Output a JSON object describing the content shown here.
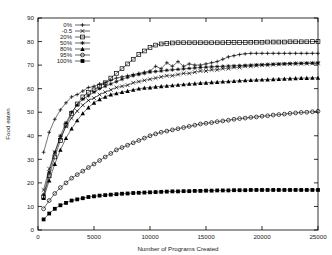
{
  "chart_data": {
    "type": "line",
    "title": "",
    "xlabel": "Number of Programs Created",
    "ylabel": "Food eaten",
    "xlim": [
      0,
      25000
    ],
    "ylim": [
      0,
      90
    ],
    "xticks": [
      0,
      5000,
      10000,
      15000,
      20000,
      25000
    ],
    "xtick_labels": [
      "0",
      "5000",
      "10000",
      "15000",
      "20000",
      "25000"
    ],
    "yticks": [
      0,
      10,
      20,
      30,
      40,
      50,
      60,
      70,
      80,
      90
    ],
    "ytick_labels": [
      "0",
      "10",
      "20",
      "30",
      "40",
      "50",
      "60",
      "70",
      "80",
      "90"
    ],
    "grid": false,
    "legend_position": "top-left-inside",
    "frame": true,
    "colors": {
      "ink": "#000000",
      "background": "#ffffff"
    },
    "x": [
      500,
      1000,
      1500,
      2000,
      2500,
      3000,
      3500,
      4000,
      4500,
      5000,
      5500,
      6000,
      6500,
      7000,
      7500,
      8000,
      8500,
      9000,
      9500,
      10000,
      10500,
      11000,
      11500,
      12000,
      12500,
      13000,
      13500,
      14000,
      14500,
      15000,
      15500,
      16000,
      16500,
      17000,
      17500,
      18000,
      18500,
      19000,
      19500,
      20000,
      20500,
      21000,
      21500,
      22000,
      22500,
      23000,
      23500,
      24000,
      24500,
      25000
    ],
    "series": [
      {
        "name": "0%",
        "label": "0%",
        "marker": "plus",
        "values": [
          33.0,
          41.5,
          47.0,
          51.0,
          54.0,
          56.5,
          57.5,
          59.0,
          60.5,
          61.0,
          62.0,
          62.5,
          63.5,
          64.5,
          65.0,
          65.5,
          66.0,
          66.5,
          67.0,
          67.5,
          69.5,
          68.5,
          71.0,
          69.5,
          71.5,
          69.5,
          70.5,
          70.0,
          70.0,
          70.5,
          71.0,
          71.5,
          72.5,
          73.5,
          74.0,
          74.5,
          74.8,
          75.0,
          75.0,
          75.0,
          75.0,
          75.0,
          75.0,
          75.0,
          75.0,
          75.0,
          75.0,
          75.0,
          75.0,
          75.0
        ]
      },
      {
        "name": "-0.5",
        "label": "-0.5",
        "marker": "cross",
        "values": [
          17.0,
          26.0,
          33.0,
          39.0,
          44.0,
          47.5,
          50.5,
          53.0,
          55.0,
          56.0,
          57.5,
          58.5,
          59.5,
          60.5,
          61.0,
          61.5,
          62.5,
          63.0,
          63.5,
          64.0,
          64.5,
          65.0,
          65.5,
          65.5,
          66.0,
          66.5,
          66.5,
          67.0,
          67.5,
          67.5,
          68.0,
          68.0,
          68.5,
          68.5,
          69.0,
          69.0,
          69.5,
          69.5,
          69.8,
          70.0,
          70.0,
          70.2,
          70.3,
          70.4,
          70.5,
          70.5,
          70.6,
          70.6,
          70.7,
          70.7
        ]
      },
      {
        "name": "20%",
        "label": "20%",
        "marker": "open-square",
        "values": [
          14.0,
          23.0,
          31.0,
          38.0,
          44.5,
          49.5,
          53.5,
          56.5,
          58.5,
          59.5,
          61.0,
          62.5,
          64.5,
          66.5,
          68.5,
          70.5,
          72.5,
          74.5,
          76.0,
          77.5,
          78.5,
          79.0,
          79.2,
          79.4,
          79.5,
          79.5,
          79.5,
          79.5,
          79.5,
          79.5,
          79.5,
          79.5,
          79.5,
          79.6,
          79.6,
          79.6,
          79.6,
          79.7,
          79.7,
          79.7,
          79.8,
          79.8,
          79.8,
          79.8,
          79.9,
          79.9,
          79.9,
          79.9,
          80.0,
          80.0
        ]
      },
      {
        "name": "50%",
        "label": "50%",
        "marker": "star",
        "values": [
          15.0,
          24.5,
          33.0,
          40.0,
          45.5,
          50.0,
          53.0,
          55.5,
          57.0,
          58.5,
          60.0,
          61.0,
          62.0,
          63.0,
          64.0,
          64.8,
          65.5,
          66.0,
          66.5,
          67.0,
          67.3,
          67.5,
          67.8,
          68.0,
          68.2,
          68.4,
          68.6,
          68.8,
          69.0,
          69.1,
          69.3,
          69.4,
          69.5,
          69.6,
          69.7,
          69.8,
          69.9,
          70.0,
          70.1,
          70.2,
          70.3,
          70.4,
          70.5,
          70.6,
          70.7,
          70.8,
          70.8,
          70.9,
          70.9,
          71.0
        ]
      },
      {
        "name": "80%",
        "label": "80%",
        "marker": "filled-triangle",
        "values": [
          13.5,
          21.0,
          28.0,
          34.0,
          39.0,
          43.0,
          46.5,
          49.5,
          52.0,
          54.0,
          55.5,
          56.5,
          57.5,
          58.0,
          58.5,
          59.0,
          59.5,
          60.0,
          60.3,
          60.5,
          60.8,
          61.0,
          61.2,
          61.4,
          61.6,
          61.8,
          62.0,
          62.2,
          62.4,
          62.5,
          62.7,
          62.8,
          63.0,
          63.1,
          63.2,
          63.4,
          63.5,
          63.6,
          63.7,
          63.8,
          63.9,
          64.0,
          64.1,
          64.2,
          64.3,
          64.4,
          64.5,
          64.5,
          64.6,
          64.6
        ]
      },
      {
        "name": "95%",
        "label": "95%",
        "marker": "open-circle",
        "values": [
          9.0,
          12.5,
          15.5,
          18.0,
          20.0,
          22.0,
          23.5,
          25.0,
          26.5,
          28.0,
          29.5,
          31.0,
          32.5,
          34.0,
          35.0,
          36.0,
          37.0,
          38.0,
          39.0,
          40.0,
          40.8,
          41.5,
          42.0,
          42.5,
          43.0,
          43.5,
          44.0,
          44.5,
          45.0,
          45.3,
          45.6,
          46.0,
          46.3,
          46.6,
          47.0,
          47.3,
          47.5,
          47.8,
          48.0,
          48.3,
          48.5,
          48.8,
          49.0,
          49.2,
          49.5,
          49.7,
          49.9,
          50.0,
          50.2,
          50.4
        ]
      },
      {
        "name": "100%",
        "label": "100%",
        "marker": "filled-square",
        "values": [
          4.5,
          7.0,
          9.0,
          10.5,
          11.5,
          12.5,
          13.0,
          13.5,
          14.0,
          14.3,
          14.6,
          14.8,
          15.0,
          15.2,
          15.4,
          15.5,
          15.7,
          15.8,
          15.9,
          16.0,
          16.1,
          16.2,
          16.3,
          16.4,
          16.4,
          16.5,
          16.5,
          16.6,
          16.6,
          16.7,
          16.7,
          16.8,
          16.8,
          16.8,
          16.9,
          16.9,
          16.9,
          17.0,
          17.0,
          17.0,
          17.0,
          17.0,
          17.0,
          17.0,
          17.0,
          17.0,
          17.0,
          17.0,
          17.0,
          17.0
        ]
      }
    ]
  }
}
